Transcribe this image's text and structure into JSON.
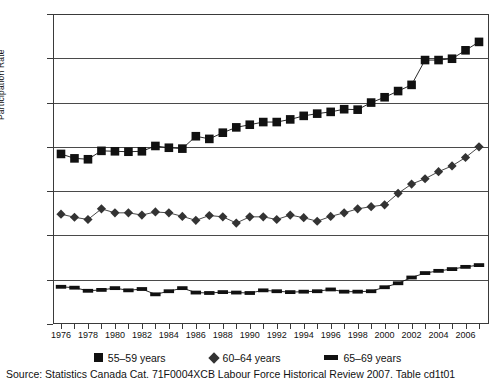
{
  "chart_data": {
    "type": "line",
    "title": "",
    "xlabel": "",
    "ylabel": "Participation Rate",
    "ylim": [
      0,
      70
    ],
    "xlim": [
      1976,
      2007
    ],
    "yticks": [
      0,
      10,
      20,
      30,
      40,
      50,
      60,
      70
    ],
    "grid": true,
    "legend_position": "bottom",
    "x": [
      1976,
      1977,
      1978,
      1979,
      1980,
      1981,
      1982,
      1983,
      1984,
      1985,
      1986,
      1987,
      1988,
      1989,
      1990,
      1991,
      1992,
      1993,
      1994,
      1995,
      1996,
      1997,
      1998,
      1999,
      2000,
      2001,
      2002,
      2003,
      2004,
      2005,
      2006,
      2007
    ],
    "xtick_labels": [
      "1976",
      "1978",
      "1980",
      "1982",
      "1984",
      "1986",
      "1988",
      "1990",
      "1992",
      "1994",
      "1996",
      "1998",
      "2000",
      "2002",
      "2004",
      "2006"
    ],
    "series": [
      {
        "name": "55–59 years",
        "marker": "square",
        "color": "#111111",
        "values": [
          38.4,
          37.4,
          37.2,
          39.1,
          39.0,
          38.9,
          39.0,
          40.2,
          39.8,
          39.6,
          42.4,
          41.8,
          43.2,
          44.4,
          45.0,
          45.6,
          45.6,
          46.2,
          47.0,
          47.5,
          47.9,
          48.5,
          48.4,
          50.0,
          51.2,
          52.6,
          54.0,
          59.6,
          59.6,
          59.9,
          61.8,
          63.7
        ]
      },
      {
        "name": "60–64 years",
        "marker": "diamond",
        "color": "#333333",
        "values": [
          24.8,
          24.1,
          23.6,
          26.0,
          25.1,
          25.1,
          24.6,
          25.3,
          25.1,
          24.3,
          23.4,
          24.5,
          24.2,
          22.8,
          24.2,
          24.2,
          23.6,
          24.6,
          24.0,
          23.2,
          24.3,
          25.1,
          26.0,
          26.5,
          26.9,
          29.5,
          31.6,
          32.8,
          34.4,
          35.7,
          37.6,
          40.0
        ]
      },
      {
        "name": "65–69 years",
        "marker": "dash",
        "color": "#111111",
        "values": [
          8.4,
          8.2,
          7.5,
          7.7,
          8.1,
          7.6,
          7.9,
          6.7,
          7.4,
          8.1,
          7.1,
          7.0,
          7.2,
          7.1,
          7.0,
          7.6,
          7.4,
          7.2,
          7.3,
          7.4,
          7.8,
          7.3,
          7.3,
          7.4,
          8.3,
          9.2,
          10.5,
          11.5,
          12.0,
          12.4,
          12.9,
          13.3
        ]
      }
    ]
  },
  "axis": {
    "y_title": "Participation Rate"
  },
  "legend": {
    "items": [
      {
        "label": "55–59 years",
        "marker": "square-marker"
      },
      {
        "label": "60–64 years",
        "marker": "diamond-marker"
      },
      {
        "label": "65–69 years",
        "marker": "dash-marker"
      }
    ]
  },
  "source": {
    "text": "Source: Statistics Canada Cat. 71F0004XCB Labour Force Historical Review 2007. Table  cd1t01"
  }
}
